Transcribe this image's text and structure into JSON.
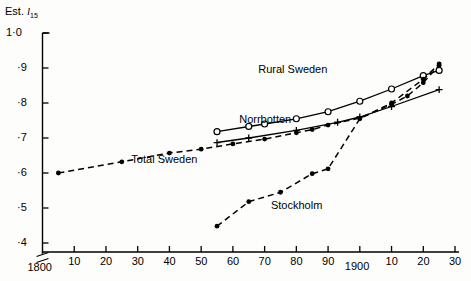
{
  "chart_data": {
    "type": "line",
    "title": "",
    "ylabel": "Est. l15",
    "ylabel_prefix": "Est.",
    "ylabel_symbol": "l",
    "ylabel_subscript": "15",
    "xlabel": "",
    "xlim": [
      1800,
      1930
    ],
    "ylim": [
      0.37,
      1.0
    ],
    "grid": false,
    "legend": "inline-annotations",
    "y_ticks": [
      {
        "value": 1.0,
        "label": "1·0"
      },
      {
        "value": 0.9,
        "label": "·9"
      },
      {
        "value": 0.8,
        "label": "·8"
      },
      {
        "value": 0.7,
        "label": "·7"
      },
      {
        "value": 0.6,
        "label": "·6"
      },
      {
        "value": 0.5,
        "label": "·5"
      },
      {
        "value": 0.4,
        "label": "·4"
      }
    ],
    "x_ticks": [
      {
        "value": 1800,
        "label": "1800"
      },
      {
        "value": 1810,
        "label": "10"
      },
      {
        "value": 1820,
        "label": "20"
      },
      {
        "value": 1830,
        "label": "30"
      },
      {
        "value": 1840,
        "label": "40"
      },
      {
        "value": 1850,
        "label": "50"
      },
      {
        "value": 1860,
        "label": "60"
      },
      {
        "value": 1870,
        "label": "70"
      },
      {
        "value": 1880,
        "label": "80"
      },
      {
        "value": 1890,
        "label": "90"
      },
      {
        "value": 1900,
        "label": "1900"
      },
      {
        "value": 1910,
        "label": "10"
      },
      {
        "value": 1920,
        "label": "20"
      },
      {
        "value": 1930,
        "label": "30"
      }
    ],
    "series": [
      {
        "name": "Total Sweden",
        "label": "Total Sweden",
        "marker": "filled-dot",
        "linestyle": "dashed",
        "color": "#000000",
        "points": [
          {
            "x": 1805,
            "y": 0.6
          },
          {
            "x": 1825,
            "y": 0.632
          },
          {
            "x": 1840,
            "y": 0.657
          },
          {
            "x": 1850,
            "y": 0.668
          },
          {
            "x": 1860,
            "y": 0.683
          },
          {
            "x": 1870,
            "y": 0.697
          },
          {
            "x": 1880,
            "y": 0.715
          },
          {
            "x": 1885,
            "y": 0.724
          },
          {
            "x": 1890,
            "y": 0.737
          },
          {
            "x": 1900,
            "y": 0.757
          },
          {
            "x": 1910,
            "y": 0.796
          },
          {
            "x": 1915,
            "y": 0.82
          },
          {
            "x": 1920,
            "y": 0.858
          },
          {
            "x": 1925,
            "y": 0.908
          }
        ]
      },
      {
        "name": "Rural Sweden",
        "label": "Rural Sweden",
        "marker": "open-circle",
        "linestyle": "solid",
        "color": "#000000",
        "points": [
          {
            "x": 1855,
            "y": 0.718
          },
          {
            "x": 1865,
            "y": 0.733
          },
          {
            "x": 1870,
            "y": 0.74
          },
          {
            "x": 1880,
            "y": 0.755
          },
          {
            "x": 1890,
            "y": 0.775
          },
          {
            "x": 1900,
            "y": 0.805
          },
          {
            "x": 1910,
            "y": 0.84
          },
          {
            "x": 1920,
            "y": 0.878
          },
          {
            "x": 1925,
            "y": 0.893
          }
        ]
      },
      {
        "name": "Norrbotten",
        "label": "Norrbotten",
        "marker": "plus",
        "linestyle": "solid",
        "color": "#000000",
        "points": [
          {
            "x": 1855,
            "y": 0.687
          },
          {
            "x": 1865,
            "y": 0.7
          },
          {
            "x": 1880,
            "y": 0.722
          },
          {
            "x": 1893,
            "y": 0.745
          },
          {
            "x": 1900,
            "y": 0.76
          },
          {
            "x": 1910,
            "y": 0.79
          },
          {
            "x": 1925,
            "y": 0.838
          }
        ]
      },
      {
        "name": "Stockholm",
        "label": "Stockholm",
        "marker": "filled-dot",
        "linestyle": "dashed",
        "color": "#000000",
        "points": [
          {
            "x": 1855,
            "y": 0.448
          },
          {
            "x": 1865,
            "y": 0.518
          },
          {
            "x": 1875,
            "y": 0.545
          },
          {
            "x": 1885,
            "y": 0.598
          },
          {
            "x": 1890,
            "y": 0.612
          },
          {
            "x": 1900,
            "y": 0.755
          },
          {
            "x": 1910,
            "y": 0.8
          },
          {
            "x": 1920,
            "y": 0.868
          },
          {
            "x": 1925,
            "y": 0.912
          }
        ]
      }
    ],
    "annotations": [
      {
        "text": "Rural Sweden",
        "x": 1868,
        "y": 0.893
      },
      {
        "text": "Norrbotten",
        "x": 1862,
        "y": 0.752
      },
      {
        "text": "Total Sweden",
        "x": 1828,
        "y": 0.638
      },
      {
        "text": "Stockholm",
        "x": 1872,
        "y": 0.505
      }
    ]
  }
}
